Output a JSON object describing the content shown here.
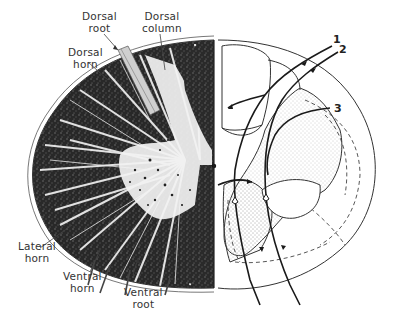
{
  "figure": {
    "left_half": "histological stained section",
    "right_half": "schematic with neuron pathways and tracts"
  },
  "labels": {
    "dorsal_root": "Dorsal\nroot",
    "dorsal_column": "Dorsal\ncolumn",
    "dorsal_horn": "Dorsal\nhorn",
    "lateral_horn": "Lateral\nhorn",
    "ventral_horn": "Ventral\nhorn",
    "ventral_root": "Ventral\nroot"
  },
  "pathway_numbers": {
    "n1": "1",
    "n2": "2",
    "n3": "3"
  },
  "colors": {
    "ink": "#1a1a1a",
    "label": "#333333",
    "background": "#ffffff",
    "stipple": "#9a9a9a"
  }
}
